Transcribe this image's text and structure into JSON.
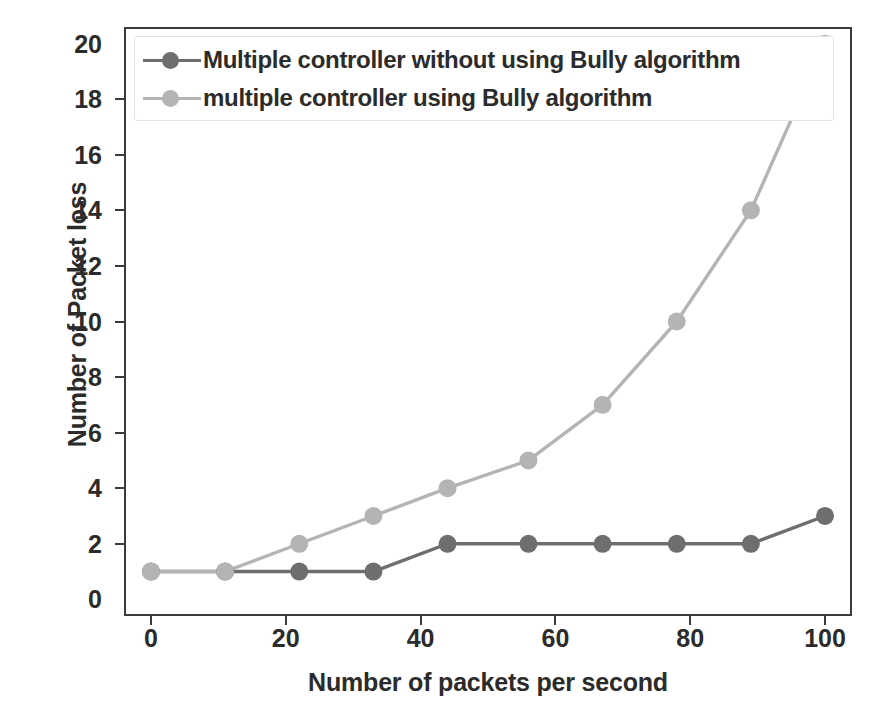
{
  "chart_data": {
    "type": "line",
    "title": "",
    "xlabel": "Number of packets per second",
    "ylabel": "Number of Packet loss",
    "xlim": [
      -4,
      104
    ],
    "ylim": [
      -0.6,
      20.6
    ],
    "xticks": [
      0,
      20,
      40,
      60,
      80,
      100
    ],
    "yticks": [
      0,
      2,
      4,
      6,
      8,
      10,
      12,
      14,
      16,
      18,
      20
    ],
    "grid": false,
    "legend_position": "upper left",
    "x": [
      0,
      11,
      22,
      33,
      44,
      56,
      67,
      78,
      89,
      100
    ],
    "series": [
      {
        "name": "Multiple controller without using Bully algorithm",
        "color": "#6e6e6e",
        "marker": "o",
        "values": [
          1,
          1,
          1,
          1,
          2,
          2,
          2,
          2,
          2,
          3
        ]
      },
      {
        "name": "multiple controller using Bully algorithm",
        "color": "#b4b4b4",
        "marker": "o",
        "values": [
          1,
          1,
          2,
          3,
          4,
          5,
          7,
          10,
          14,
          20
        ]
      }
    ]
  },
  "legend": {
    "items": [
      {
        "label": "Multiple controller without using Bully algorithm",
        "color": "#6e6e6e"
      },
      {
        "label": "multiple controller using Bully algorithm",
        "color": "#b4b4b4"
      }
    ]
  },
  "axes": {
    "x_title": "Number of packets per second",
    "y_title": "Number of Packet loss",
    "x_tick_labels": [
      "0",
      "20",
      "40",
      "60",
      "80",
      "100"
    ],
    "y_tick_labels": [
      "0",
      "2",
      "4",
      "6",
      "8",
      "10",
      "12",
      "14",
      "16",
      "18",
      "20"
    ]
  },
  "colors": {
    "series_dark": "#6e6e6e",
    "series_light": "#b4b4b4",
    "axis": "#3a3a3a",
    "text": "#2b2b2b",
    "background": "#ffffff"
  }
}
